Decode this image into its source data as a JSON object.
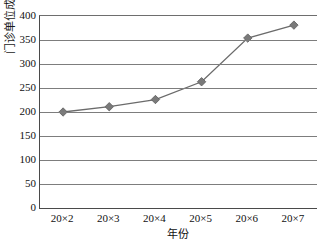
{
  "chart_data": {
    "type": "line",
    "title": "",
    "xlabel": "年份",
    "ylabel": "门诊单位成本",
    "categories": [
      "20×2",
      "20×3",
      "20×4",
      "20×5",
      "20×6",
      "20×7"
    ],
    "values": [
      200,
      211,
      226,
      263,
      354,
      381
    ],
    "series": [
      {
        "name": "门诊单位成本",
        "values": [
          200,
          211,
          226,
          263,
          354,
          381
        ]
      }
    ],
    "ylim": [
      0,
      400
    ],
    "yticks": [
      0,
      50,
      100,
      150,
      200,
      250,
      300,
      350,
      400
    ],
    "ytick_labels": [
      "0",
      "50",
      "100",
      "150",
      "200",
      "250",
      "300",
      "350",
      "400"
    ],
    "grid": true,
    "grid_axis": "y",
    "legend": false,
    "legend_position": "none",
    "marker": "diamond",
    "colors": {
      "line": "#6b6b6b",
      "marker": "#7a7a7a",
      "marker_edge": "#5c5c5c",
      "grid": "#7d7d7d",
      "axis": "#4a4a4a",
      "background": "#ffffff",
      "text": "#111111"
    }
  }
}
